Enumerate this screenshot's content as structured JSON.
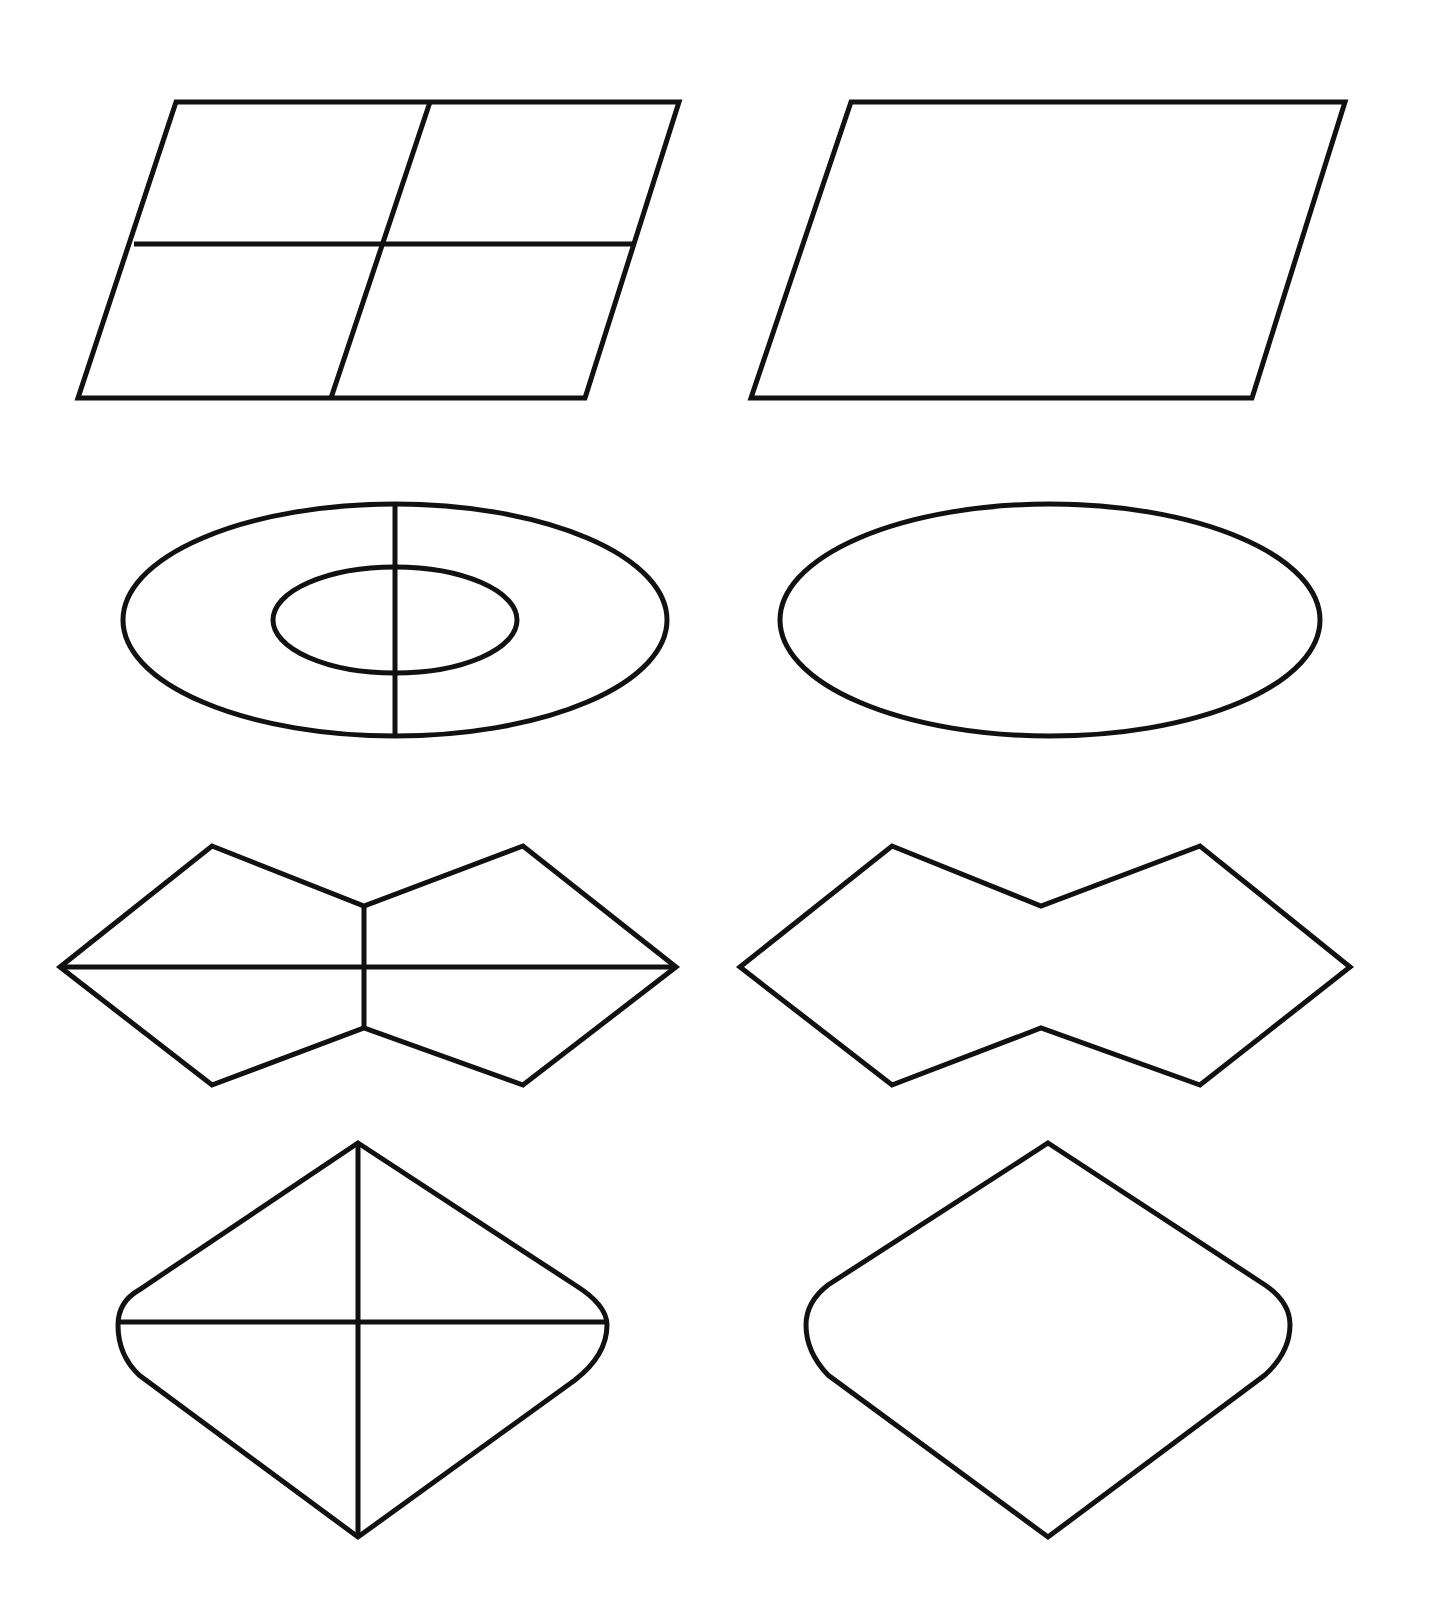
{
  "page": {
    "background": "#ffffff",
    "stroke_color": "#111111",
    "stroke_width": 5
  },
  "rows": [
    {
      "left": {
        "name": "parallelogram-divided",
        "description": "Parallelogram divided into 4 parts"
      },
      "right": {
        "name": "parallelogram",
        "description": "Plain parallelogram"
      }
    },
    {
      "left": {
        "name": "ellipse-ring-divided",
        "description": "Concentric ellipses with vertical divider"
      },
      "right": {
        "name": "ellipse",
        "description": "Plain ellipse"
      }
    },
    {
      "left": {
        "name": "bowtie-hexagon-divided",
        "description": "Concave octagon with cross dividers"
      },
      "right": {
        "name": "bowtie-hexagon",
        "description": "Plain concave octagon"
      }
    },
    {
      "left": {
        "name": "rounded-rhombus-divided",
        "description": "Rounded-side rhombus with cross dividers"
      },
      "right": {
        "name": "rounded-rhombus",
        "description": "Plain rounded-side rhombus"
      }
    }
  ]
}
